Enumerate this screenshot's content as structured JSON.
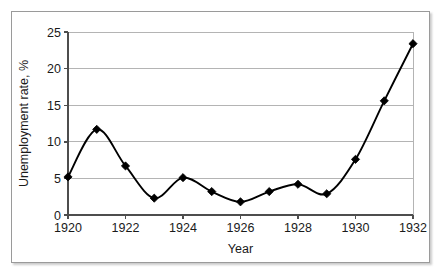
{
  "chart_data": {
    "type": "line",
    "title": "",
    "xlabel": "Year",
    "ylabel": "Unemployment rate, %",
    "x": [
      1920,
      1921,
      1922,
      1923,
      1924,
      1925,
      1926,
      1927,
      1928,
      1929,
      1930,
      1931,
      1932
    ],
    "values": [
      5.2,
      11.7,
      6.7,
      2.3,
      5.1,
      3.2,
      1.8,
      3.2,
      4.2,
      2.9,
      7.6,
      15.6,
      23.4
    ],
    "series": [
      {
        "name": "Unemployment rate",
        "values": [
          5.2,
          11.7,
          6.7,
          2.3,
          5.1,
          3.2,
          1.8,
          3.2,
          4.2,
          2.9,
          7.6,
          15.6,
          23.4
        ]
      }
    ],
    "xlim": [
      1920,
      1932
    ],
    "ylim": [
      0,
      25
    ],
    "xticks": [
      1920,
      1922,
      1924,
      1926,
      1928,
      1930,
      1932
    ],
    "xtick_labels": [
      "1920",
      "1922",
      "1924",
      "1926",
      "1928",
      "1930",
      "1932"
    ],
    "yticks": [
      0,
      5,
      10,
      15,
      20,
      25
    ],
    "ytick_labels": [
      "0",
      "5",
      "10",
      "15",
      "20",
      "25"
    ],
    "grid": "horizontal",
    "legend": "none",
    "marker": "diamond",
    "line_color": "#000000",
    "marker_color": "#000000",
    "grid_color": "#b4b4b4",
    "axis_color": "#4d4d4d",
    "smoothing": "spline"
  }
}
